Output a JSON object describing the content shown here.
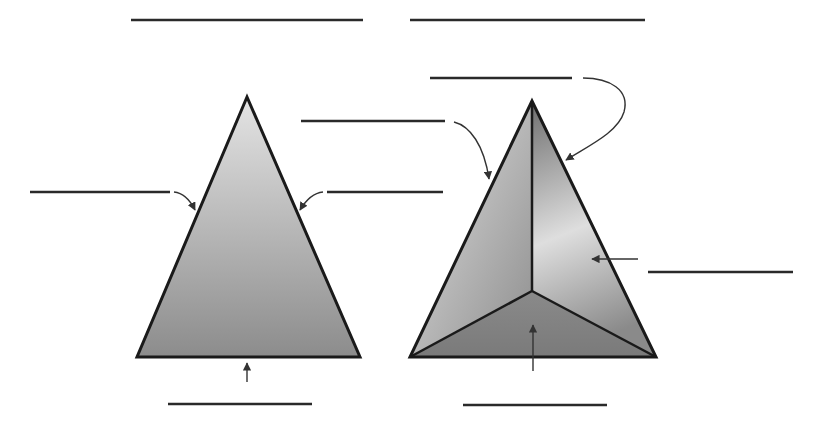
{
  "diagram": {
    "colors": {
      "background": "#ffffff",
      "outline": "#1a1a1a",
      "answer_line": "#2a2a2a",
      "arrow": "#333333",
      "fill_light": "#e6e6e6",
      "fill_mid": "#9a9a9a",
      "fill_dark": "#7c7c7c"
    },
    "figures": [
      {
        "id": "triangle",
        "title_line": {
          "x1": 131,
          "y1": 20,
          "x2": 363,
          "y2": 20,
          "text": ""
        },
        "vertices": [
          [
            247,
            97
          ],
          [
            137,
            357
          ],
          [
            360,
            357
          ]
        ],
        "labels": [
          {
            "id": "left-side",
            "line": [
              30,
              192,
              170,
              192
            ],
            "text": "",
            "arrow_to": [
              195,
              211
            ]
          },
          {
            "id": "right-side",
            "line": [
              327,
              192,
              443,
              192
            ],
            "text": "",
            "arrow_to": [
              299,
              211
            ]
          },
          {
            "id": "base",
            "line": [
              168,
              404,
              312,
              404
            ],
            "text": "",
            "arrow_to": [
              247,
              362
            ]
          }
        ]
      },
      {
        "id": "pyramid",
        "title_line": {
          "x1": 410,
          "y1": 20,
          "x2": 645,
          "y2": 20,
          "text": ""
        },
        "apex": [
          532,
          101
        ],
        "base_vertices": [
          [
            410,
            357
          ],
          [
            656,
            357
          ],
          [
            532,
            291
          ]
        ],
        "labels": [
          {
            "id": "apex-edge",
            "line": [
              430,
              78,
              572,
              78
            ],
            "text": "",
            "arrow_to": [
              565,
              161
            ]
          },
          {
            "id": "left-face",
            "line": [
              301,
              121,
              445,
              121
            ],
            "text": "",
            "arrow_to": [
              489,
              180
            ]
          },
          {
            "id": "right-face",
            "line": [
              648,
              272,
              793,
              272
            ],
            "text": "",
            "arrow_to": [
              590,
              258
            ]
          },
          {
            "id": "base-face",
            "line": [
              463,
              405,
              607,
              405
            ],
            "text": "",
            "arrow_to": [
              533,
              324
            ]
          }
        ]
      }
    ]
  }
}
